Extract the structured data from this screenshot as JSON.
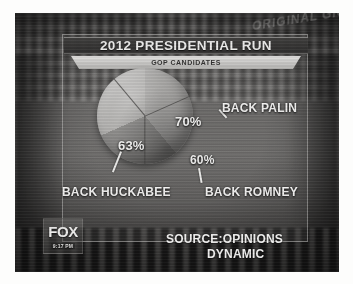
{
  "broadcast": {
    "network_bug": "FOX",
    "clock": "9:17 PM",
    "watermark": "ORIGINAL\nGIGS56"
  },
  "graphic": {
    "title": "2012 PRESIDENTIAL RUN",
    "subtitle": "GOP CANDIDATES",
    "source_line1": "SOURCE:OPINIONS",
    "source_line2": "DYNAMIC"
  },
  "chart_data": {
    "type": "pie",
    "title": "2012 PRESIDENTIAL RUN",
    "subtitle": "GOP CANDIDATES",
    "categories": [
      "BACK PALIN",
      "BACK ROMNEY",
      "BACK HUCKABEE"
    ],
    "values": [
      70,
      60,
      63
    ],
    "value_labels": [
      "70%",
      "60%",
      "63%"
    ],
    "unit": "%",
    "sum": 193,
    "note": "Slice angles do not sum to 100% — percentages are independent poll results rendered as a pie.",
    "slice_angles_deg": [
      140,
      106,
      114
    ],
    "slice_colors": [
      "#a9a49c",
      "#8e8981",
      "#b6b1a8"
    ],
    "legend": "none",
    "labels_inline": true,
    "source": "SOURCE:OPINIONS DYNAMIC"
  },
  "labels": {
    "palin_name": "BACK PALIN",
    "palin_value": "70%",
    "romney_name": "BACK ROMNEY",
    "romney_value": "60%",
    "huckabee_name": "BACK HUCKABEE",
    "huckabee_value": "63%"
  },
  "colors": {
    "panel_border": "#e2ded6",
    "title_band": "#3a3632",
    "subtitle_band": "#e9e6df",
    "text_light": "#f7f5f1",
    "pie_slice_a": "#a9a49c",
    "pie_slice_b": "#8e8981",
    "pie_slice_c": "#b6b1a8"
  }
}
